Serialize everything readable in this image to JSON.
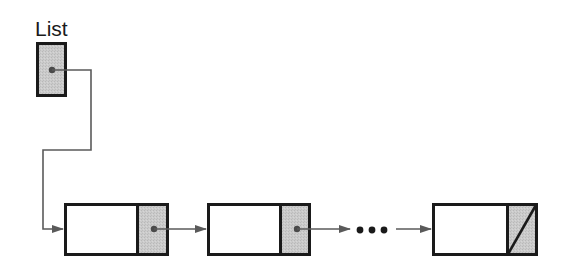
{
  "diagram": {
    "type": "singly-linked-list",
    "head_label": "List",
    "ellipsis": "• • •",
    "colors": {
      "border": "#1a1a1a",
      "pointer_fill": "#c9c9c9",
      "data_fill": "#ffffff",
      "connector": "#5a5a5a",
      "dot": "#4a4a4a",
      "ellipsis": "#1a1a1a"
    },
    "head": {
      "label": "List",
      "box": {
        "x": 36,
        "y": 42,
        "w": 31,
        "h": 55
      },
      "pointer_dot": {
        "x": 52,
        "y": 70
      }
    },
    "nodes": [
      {
        "id": "node-1",
        "x": 64,
        "y": 203,
        "w": 105,
        "h": 53,
        "divider_x": 137,
        "next": "node-2",
        "null_pointer": false
      },
      {
        "id": "node-2",
        "x": 207,
        "y": 203,
        "w": 103,
        "h": 53,
        "divider_x": 280,
        "next": "ellipsis",
        "null_pointer": false
      },
      {
        "id": "node-3",
        "x": 432,
        "y": 203,
        "w": 105,
        "h": 53,
        "divider_x": 507,
        "next": null,
        "null_pointer": true
      }
    ]
  }
}
